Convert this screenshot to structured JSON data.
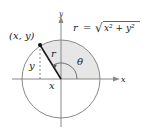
{
  "diagram": {
    "formula": {
      "lhs": "r",
      "equals": "=",
      "radical": "√",
      "radicand": "x² + y²"
    },
    "labels": {
      "point": "(x, y)",
      "x_axis": "x",
      "y_axis": "y",
      "radius": "r",
      "angle": "θ",
      "x_projection": "x",
      "y_projection": "y"
    },
    "colors": {
      "shade": "#e6e6e6",
      "line": "#777777",
      "radius_line": "#1a1a1a",
      "text": "#222222"
    }
  }
}
